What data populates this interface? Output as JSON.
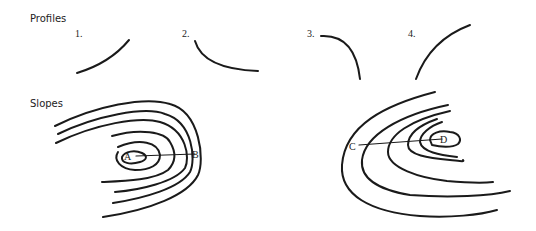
{
  "sections": {
    "profiles": {
      "title": "Profiles"
    },
    "slopes": {
      "title": "Slopes"
    }
  },
  "profiles": [
    {
      "label": "1.",
      "shape": "concave-rising"
    },
    {
      "label": "2.",
      "shape": "concave-falling"
    },
    {
      "label": "3.",
      "shape": "convex-falling"
    },
    {
      "label": "4.",
      "shape": "convex-rising"
    }
  ],
  "slopes": {
    "left_map": {
      "points": {
        "start": "A",
        "end": "B"
      }
    },
    "right_map": {
      "points": {
        "start": "C",
        "end": "D"
      }
    }
  },
  "colors": {
    "ink": "#1a1a1a",
    "background": "#ffffff"
  }
}
